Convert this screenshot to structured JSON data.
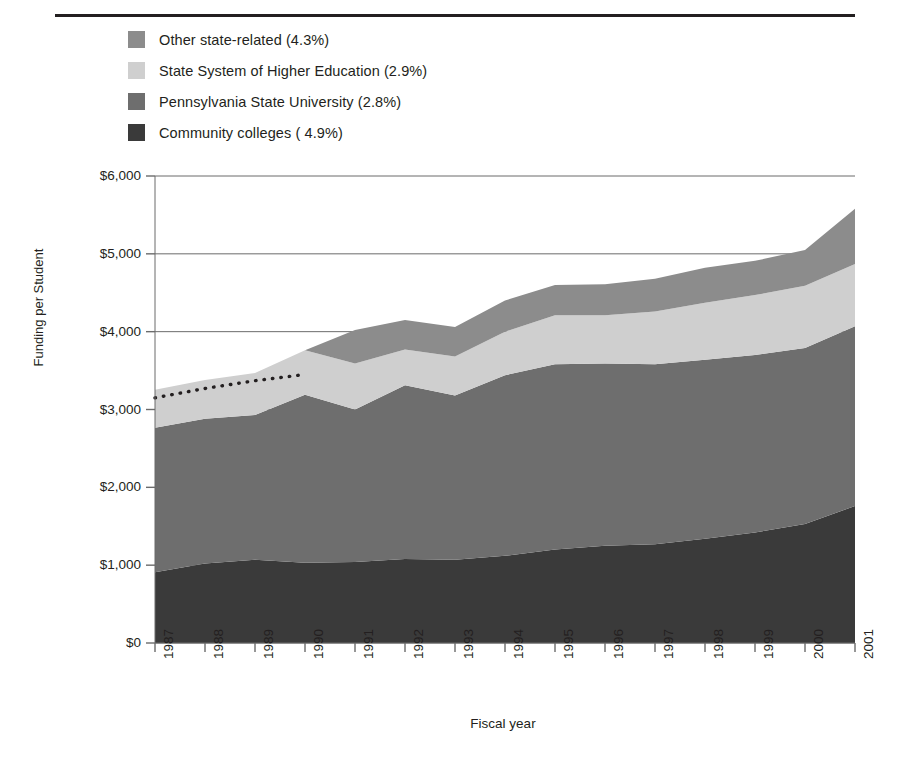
{
  "chart_data": {
    "type": "area",
    "stacked": true,
    "title": "",
    "xlabel": "Fiscal year",
    "ylabel": "Funding per Student",
    "categories": [
      "1987",
      "1988",
      "1989",
      "1990",
      "1991",
      "1992",
      "1993",
      "1994",
      "1995",
      "1996",
      "1997",
      "1998",
      "1999",
      "2000",
      "2001"
    ],
    "x": [
      1987,
      1988,
      1989,
      1990,
      1991,
      1992,
      1993,
      1994,
      1995,
      1996,
      1997,
      1998,
      1999,
      2000,
      2001
    ],
    "ylim": [
      0,
      6000
    ],
    "yticks": [
      0,
      1000,
      2000,
      3000,
      4000,
      5000,
      6000
    ],
    "ytick_labels": [
      "$0",
      "$1,000",
      "$2,000",
      "$3,000",
      "$4,000",
      "$5,000",
      "$6,000"
    ],
    "grid": true,
    "legend_position": "top-left",
    "series": [
      {
        "name": "Community colleges ( 4.9%)",
        "color": "#3a3a3a",
        "values": [
          910,
          1020,
          1070,
          1030,
          1040,
          1080,
          1070,
          1120,
          1200,
          1250,
          1270,
          1340,
          1420,
          1530,
          1760
        ]
      },
      {
        "name": "Pennsylvania State University (2.8%)",
        "color": "#6e6e6e",
        "values": [
          1855,
          1860,
          1860,
          2160,
          1960,
          2230,
          2110,
          2320,
          2380,
          2340,
          2310,
          2300,
          2280,
          2260,
          2310
        ]
      },
      {
        "name": "State System of Higher Education (2.9%)",
        "color": "#cfcfcf",
        "values": [
          490,
          500,
          540,
          570,
          590,
          460,
          500,
          560,
          630,
          620,
          680,
          730,
          770,
          800,
          800
        ]
      },
      {
        "name": "Other state-related (4.3%)",
        "color": "#8c8c8c",
        "values": [
          0,
          0,
          0,
          0,
          430,
          380,
          380,
          400,
          390,
          400,
          420,
          450,
          440,
          460,
          710
        ]
      }
    ],
    "annotations": [
      {
        "type": "dotted-line",
        "note": "dotted trend line over stack top, 1987-1990",
        "color": "#231f20",
        "x": [
          1987,
          1988,
          1989,
          1990
        ],
        "y": [
          3150,
          3270,
          3370,
          3450
        ]
      }
    ]
  },
  "legend": {
    "items": [
      {
        "label": "Other state-related (4.3%)",
        "color": "#8c8c8c"
      },
      {
        "label": "State System of Higher Education (2.9%)",
        "color": "#cfcfcf"
      },
      {
        "label": "Pennsylvania State University (2.8%)",
        "color": "#6e6e6e"
      },
      {
        "label": "Community colleges ( 4.9%)",
        "color": "#3a3a3a"
      }
    ]
  },
  "axes": {
    "y_title": "Funding per Student",
    "x_title": "Fiscal year",
    "y_ticks": [
      "$6,000",
      "$5,000",
      "$4,000",
      "$3,000",
      "$2,000",
      "$1,000",
      "$0"
    ],
    "x_ticks": [
      "1987",
      "1988",
      "1989",
      "1990",
      "1991",
      "1992",
      "1993",
      "1994",
      "1995",
      "1996",
      "1997",
      "1998",
      "1999",
      "2000",
      "2001"
    ]
  }
}
